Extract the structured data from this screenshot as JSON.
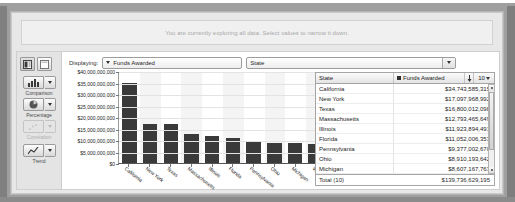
{
  "banner": {
    "message": "You are currently exploring all data. Select values to narrow it down."
  },
  "sidebar": {
    "view_toggles": [
      {
        "name": "chart-table-view",
        "label": ""
      },
      {
        "name": "table-only-view",
        "label": ""
      }
    ],
    "tools": [
      {
        "label": "Comparison",
        "icon": "bar-chart-icon",
        "disabled": false
      },
      {
        "label": "Percentage",
        "icon": "pie-chart-icon",
        "disabled": false
      },
      {
        "label": "Correlation",
        "icon": "scatter-plot-icon",
        "disabled": true
      },
      {
        "label": "Trend",
        "icon": "line-chart-icon",
        "disabled": false
      }
    ]
  },
  "toolbar": {
    "displaying_label": "Displaying:",
    "measure_value": "Funds Awarded",
    "dimension_value": "State"
  },
  "table": {
    "columns": [
      "State",
      "Funds Awarded"
    ],
    "page_size": "10",
    "rows": [
      {
        "state": "California",
        "value": "$34,743,585,315"
      },
      {
        "state": "New York",
        "value": "$17,097,968,992"
      },
      {
        "state": "Texas",
        "value": "$16,800,012,098"
      },
      {
        "state": "Massachusetts",
        "value": "$12,793,465,649"
      },
      {
        "state": "Illinois",
        "value": "$11,923,894,491"
      },
      {
        "state": "Florida",
        "value": "$11,052,006,353"
      },
      {
        "state": "Pennsylvania",
        "value": "$9,377,002,670"
      },
      {
        "state": "Ohio",
        "value": "$8,910,193,642"
      },
      {
        "state": "Michigan",
        "value": "$8,607,167,763"
      },
      {
        "state": "Washington",
        "value": "$8,431,332,222"
      }
    ],
    "total_label": "Total (10)",
    "total_value": "$139,736,629,195"
  },
  "chart_data": {
    "type": "bar",
    "title": "",
    "xlabel": "",
    "ylabel": "",
    "ylim": [
      0,
      40000000000
    ],
    "ytick_labels": [
      "$40,000,000,000",
      "$35,000,000,000",
      "$30,000,000,000",
      "$25,000,000,000",
      "$20,000,000,000",
      "$15,000,000,000",
      "$10,000,000,000",
      "$5,000,000,000",
      "$0"
    ],
    "grid": true,
    "categories": [
      "California",
      "New York",
      "Texas",
      "Massachusetts",
      "Illinois",
      "Florida",
      "Pennsylvania",
      "Ohio",
      "Michigan",
      "Washington"
    ],
    "values": [
      34743585315,
      17097968992,
      16800012098,
      12793465649,
      11923894491,
      11052006353,
      9377002670,
      8910193642,
      8607167763,
      8431332222
    ],
    "series": [
      {
        "name": "Funds Awarded",
        "values": [
          34743585315,
          17097968992,
          16800012098,
          12793465649,
          11923894491,
          11052006353,
          9377002670,
          8910193642,
          8607167763,
          8431332222
        ]
      }
    ],
    "bar_color": "#3a3a3a"
  }
}
